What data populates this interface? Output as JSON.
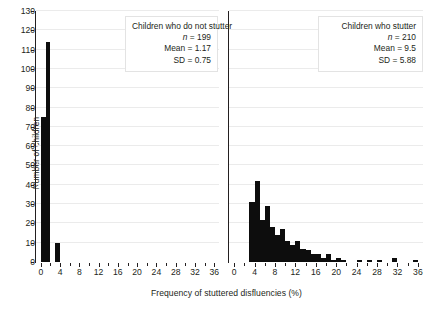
{
  "chart_data": {
    "type": "bar",
    "title": "",
    "xlabel": "Frequency of stuttered disfluencies (%)",
    "ylabel": "Number of children",
    "ylim": [
      0,
      130
    ],
    "ytick_step": 10,
    "xlim": [
      -1,
      37
    ],
    "xtick_step": 2,
    "xlabel_step": 4,
    "grid": "horizontal",
    "legend": "none",
    "bin_width": 1,
    "panels": [
      {
        "id": "left",
        "group": "Children who do not stutter",
        "n": 199,
        "mean": 1.17,
        "sd": 0.75,
        "annotation": {
          "line1": "Children who do not stutter",
          "line2_label": "n",
          "line2_value": " = 199",
          "line3": "Mean = 1.17",
          "line4": "SD = 0.75"
        },
        "bins": [
          {
            "x0": 0,
            "x1": 1,
            "count": 75
          },
          {
            "x0": 1,
            "x1": 2,
            "count": 114
          },
          {
            "x0": 2,
            "x1": 3,
            "count": 0
          },
          {
            "x0": 3,
            "x1": 4,
            "count": 10
          }
        ]
      },
      {
        "id": "right",
        "group": "Children who stutter",
        "n": 210,
        "mean": 9.5,
        "sd": 5.88,
        "annotation": {
          "line1": "Children who stutter",
          "line2_label": "n",
          "line2_value": " = 210",
          "line3": "Mean = 9.5",
          "line4": "SD = 5.88"
        },
        "bins": [
          {
            "x0": 3,
            "x1": 4,
            "count": 31
          },
          {
            "x0": 4,
            "x1": 5,
            "count": 42
          },
          {
            "x0": 5,
            "x1": 6,
            "count": 22
          },
          {
            "x0": 6,
            "x1": 7,
            "count": 29
          },
          {
            "x0": 7,
            "x1": 8,
            "count": 18
          },
          {
            "x0": 8,
            "x1": 9,
            "count": 14
          },
          {
            "x0": 9,
            "x1": 10,
            "count": 17
          },
          {
            "x0": 10,
            "x1": 11,
            "count": 11
          },
          {
            "x0": 11,
            "x1": 12,
            "count": 9
          },
          {
            "x0": 12,
            "x1": 13,
            "count": 11
          },
          {
            "x0": 13,
            "x1": 14,
            "count": 7
          },
          {
            "x0": 14,
            "x1": 15,
            "count": 6
          },
          {
            "x0": 15,
            "x1": 16,
            "count": 4
          },
          {
            "x0": 16,
            "x1": 17,
            "count": 4
          },
          {
            "x0": 17,
            "x1": 18,
            "count": 2
          },
          {
            "x0": 18,
            "x1": 19,
            "count": 4
          },
          {
            "x0": 19,
            "x1": 20,
            "count": 1
          },
          {
            "x0": 20,
            "x1": 21,
            "count": 2
          },
          {
            "x0": 21,
            "x1": 22,
            "count": 1
          },
          {
            "x0": 24,
            "x1": 25,
            "count": 1
          },
          {
            "x0": 26,
            "x1": 27,
            "count": 1
          },
          {
            "x0": 28,
            "x1": 29,
            "count": 1
          },
          {
            "x0": 31,
            "x1": 32,
            "count": 2
          },
          {
            "x0": 35,
            "x1": 36,
            "count": 1
          }
        ]
      }
    ],
    "ytick_labels": [
      0,
      10,
      20,
      30,
      40,
      50,
      60,
      70,
      80,
      90,
      100,
      110,
      120,
      130
    ],
    "xtick_labels": [
      0,
      4,
      8,
      12,
      16,
      20,
      24,
      28,
      32,
      36
    ]
  }
}
